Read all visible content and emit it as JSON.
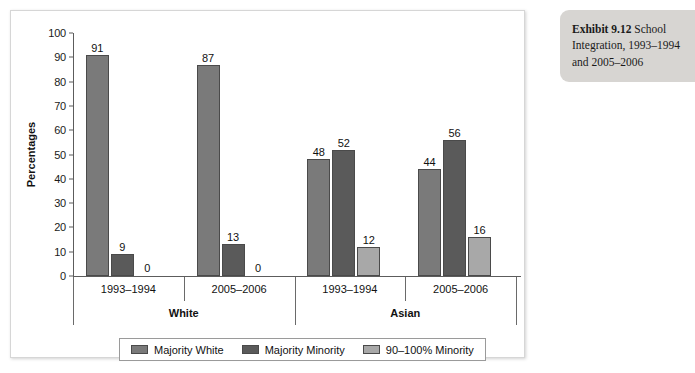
{
  "exhibit": {
    "number_label": "Exhibit 9.12",
    "title_rest": " School Integration, 1993–1994 and 2005–2006"
  },
  "chart_data": {
    "type": "bar",
    "title": "",
    "xlabel": "",
    "ylabel": "Percentages",
    "ylim": [
      0,
      100
    ],
    "ytick_step": 10,
    "yticks": [
      "100",
      "90",
      "80",
      "70",
      "60",
      "50",
      "40",
      "30",
      "20",
      "10",
      "0"
    ],
    "grid": false,
    "legend_position": "bottom",
    "groups": [
      "White",
      "Asian"
    ],
    "categories": [
      "1993–1994",
      "2005–2006",
      "1993–1994",
      "2005–2006"
    ],
    "group_spans": [
      2,
      2
    ],
    "series": [
      {
        "name": "Majority White",
        "color": "#7a7a7a",
        "values": [
          91,
          87,
          48,
          44
        ]
      },
      {
        "name": "Majority Minority",
        "color": "#5a5a5a",
        "values": [
          9,
          13,
          52,
          56
        ]
      },
      {
        "name": "90–100% Minority",
        "color": "#a8a8a8",
        "values": [
          0,
          0,
          12,
          16
        ]
      }
    ],
    "data_labels": [
      [
        "91",
        "87",
        "48",
        "44"
      ],
      [
        "9",
        "13",
        "52",
        "56"
      ],
      [
        "0",
        "0",
        "12",
        "16"
      ]
    ]
  }
}
